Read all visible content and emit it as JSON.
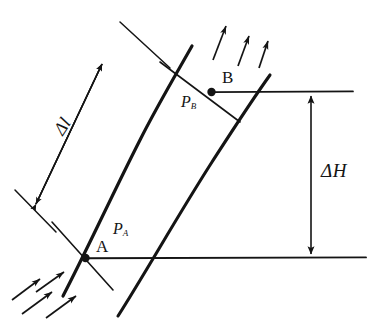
{
  "figure": {
    "type": "technical-line-diagram",
    "background_color": "#ffffff",
    "ink_color": "#141414",
    "labels": {
      "point_a": "A",
      "point_b": "B",
      "pressure_a": "P",
      "pressure_a_sub": "A",
      "pressure_b": "P",
      "pressure_b_sub": "B",
      "delta_height": "ΔH",
      "delta_length": "Δl"
    },
    "annotations": {
      "delta_length_dimension": "Δl",
      "delta_height_dimension": "ΔH",
      "flow_arrows_top_count": 3,
      "flow_arrows_bottom_count": 4
    },
    "geometry": {
      "point_a": {
        "x": 85,
        "y": 258
      },
      "point_b": {
        "x": 211,
        "y": 92
      },
      "lower_datum_line": {
        "x1": 85,
        "y1": 258,
        "x2": 366,
        "y2": 258
      },
      "upper_datum_line": {
        "x1": 211,
        "y1": 92,
        "x2": 353,
        "y2": 92
      },
      "delta_height_axis_x": 311
    }
  }
}
